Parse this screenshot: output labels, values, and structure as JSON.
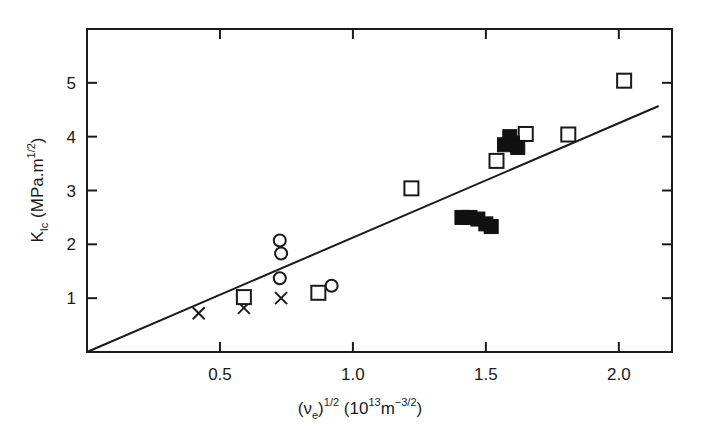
{
  "chart_data": {
    "type": "scatter",
    "title": "",
    "xlabel": "(ν_e)^1/2 (10^13 m^-3/2)",
    "ylabel": "K_Ic (MPa.m^1/2)",
    "xlim": [
      0,
      2.2
    ],
    "ylim": [
      0,
      6
    ],
    "grid": false,
    "legend": null,
    "x_ticks": [
      0.5,
      1.0,
      1.5,
      2.0
    ],
    "x_tick_labels": [
      "0.5",
      "1.0",
      "1.5",
      "2.0"
    ],
    "y_ticks": [
      1,
      2,
      3,
      4,
      5
    ],
    "y_tick_labels": [
      "1",
      "2",
      "3",
      "4",
      "5"
    ],
    "series": [
      {
        "name": "crosses",
        "marker": "x",
        "points": [
          [
            0.42,
            0.72
          ],
          [
            0.59,
            0.82
          ],
          [
            0.73,
            1.0
          ]
        ]
      },
      {
        "name": "open circles",
        "marker": "open-circle",
        "points": [
          [
            0.725,
            2.07
          ],
          [
            0.73,
            1.83
          ],
          [
            0.725,
            1.37
          ],
          [
            0.92,
            1.23
          ]
        ]
      },
      {
        "name": "open squares",
        "marker": "open-square",
        "points": [
          [
            0.59,
            1.02
          ],
          [
            0.87,
            1.1
          ],
          [
            1.22,
            3.04
          ],
          [
            1.54,
            3.55
          ],
          [
            1.65,
            4.05
          ],
          [
            1.81,
            4.04
          ],
          [
            2.02,
            5.04
          ]
        ]
      },
      {
        "name": "filled squares",
        "marker": "filled-square",
        "points": [
          [
            1.41,
            2.5
          ],
          [
            1.44,
            2.5
          ],
          [
            1.47,
            2.47
          ],
          [
            1.5,
            2.38
          ],
          [
            1.52,
            2.33
          ],
          [
            1.57,
            3.85
          ],
          [
            1.59,
            4.0
          ],
          [
            1.6,
            3.88
          ],
          [
            1.62,
            3.8
          ]
        ]
      }
    ],
    "fit_line": {
      "x": [
        0,
        2.15
      ],
      "y": [
        0,
        4.57
      ]
    }
  },
  "labels": {
    "x_axis": {
      "base": "(ν",
      "sub": "e",
      "close": ")",
      "exp": "1/2",
      "unit_open": " (10",
      "unit_exp1": "13",
      "unit_mid": "m",
      "unit_exp2": "−3/2",
      "unit_close": ")"
    },
    "y_axis": {
      "base": "K",
      "sub": "Ic",
      "unit_open": " (MPa.m",
      "unit_exp": "1/2",
      "unit_close": ")"
    }
  }
}
